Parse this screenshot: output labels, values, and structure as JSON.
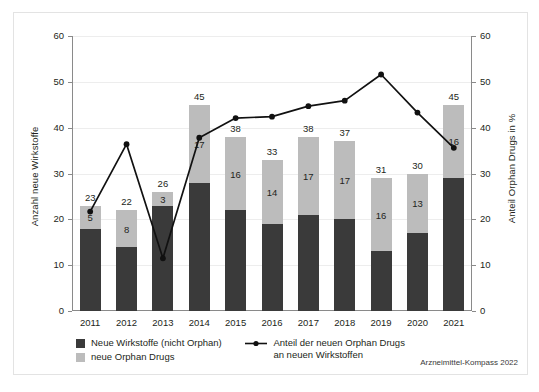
{
  "chart_data": {
    "type": "bar",
    "title": "",
    "subtitle": "",
    "xlabel": "",
    "ylabel": "Anzahl neue Wirkstoffe",
    "ylabel_right": "Anteil Orphan Drugs in %",
    "categories": [
      "2011",
      "2012",
      "2013",
      "2014",
      "2015",
      "2016",
      "2017",
      "2018",
      "2019",
      "2020",
      "2021"
    ],
    "ylim": [
      0,
      60
    ],
    "ylim_right": [
      0,
      60
    ],
    "yticks": [
      0,
      10,
      20,
      30,
      40,
      50,
      60
    ],
    "yticks_right": [
      0,
      10,
      20,
      30,
      40,
      50,
      60
    ],
    "grid": true,
    "legend_position": "bottom-left",
    "stacked": true,
    "series": [
      {
        "name": "Neue Wirkstoffe (nicht Orphan)",
        "type": "bar",
        "color": "#3a3a3a",
        "values": [
          18,
          14,
          23,
          28,
          22,
          19,
          21,
          20,
          13,
          17,
          29
        ]
      },
      {
        "name": "neue Orphan Drugs",
        "type": "bar",
        "color": "#bcbcbc",
        "values": [
          5,
          8,
          3,
          17,
          16,
          14,
          17,
          17,
          16,
          13,
          16
        ]
      },
      {
        "name": "Anteil der neuen Orphan Drugs an neuen Wirkstoffen",
        "type": "line",
        "color": "#111111",
        "axis": "right",
        "unit": "%",
        "values": [
          21.7,
          36.4,
          11.5,
          37.8,
          42.1,
          42.4,
          44.7,
          45.9,
          51.6,
          43.3,
          35.6
        ]
      }
    ],
    "bar_totals": [
      23,
      22,
      26,
      45,
      38,
      33,
      38,
      37,
      31,
      30,
      45
    ],
    "orphan_labels": [
      5,
      8,
      3,
      17,
      16,
      14,
      17,
      17,
      16,
      13,
      16
    ]
  },
  "legend": {
    "item_bar_dark": "Neue Wirkstoffe (nicht Orphan)",
    "item_bar_light": "neue Orphan Drugs",
    "item_line_line1": "Anteil der neuen Orphan Drugs",
    "item_line_line2": "an neuen Wirkstoffen"
  },
  "footer": {
    "source": "Arzneimittel-Kompass 2022"
  }
}
